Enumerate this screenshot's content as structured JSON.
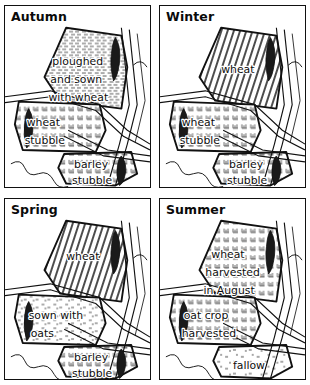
{
  "figure": {
    "kind": "seasonal-field-map-grid",
    "columns": 2,
    "rows": 2,
    "ink_color": "#111111",
    "background_color": "#ffffff"
  },
  "panels": [
    {
      "id": "autumn",
      "title": "Autumn",
      "position": "top-left",
      "labels": [
        {
          "name": "upper-field-label",
          "lines": [
            "ploughed",
            "and sown",
            "with wheat"
          ],
          "texture": "ploughed-furrows"
        },
        {
          "name": "middle-field-label",
          "lines": [
            "wheat",
            "stubble"
          ],
          "texture": "stubble-ticks"
        },
        {
          "name": "lower-field-label",
          "lines": [
            "barley",
            "stubble"
          ],
          "texture": "stubble-ticks"
        }
      ]
    },
    {
      "id": "winter",
      "title": "Winter",
      "position": "top-right",
      "labels": [
        {
          "name": "upper-field-label",
          "lines": [
            "wheat"
          ],
          "texture": "dense-diagonal-hatch"
        },
        {
          "name": "middle-field-label",
          "lines": [
            "wheat",
            "stubble"
          ],
          "texture": "stubble-ticks"
        },
        {
          "name": "lower-field-label",
          "lines": [
            "barley",
            "stubble"
          ],
          "texture": "stubble-ticks"
        }
      ]
    },
    {
      "id": "spring",
      "title": "Spring",
      "position": "bottom-left",
      "labels": [
        {
          "name": "upper-field-label",
          "lines": [
            "wheat"
          ],
          "texture": "dense-diagonal-hatch"
        },
        {
          "name": "middle-field-label",
          "lines": [
            "sown with",
            "oats"
          ],
          "texture": "stipple-seed"
        },
        {
          "name": "lower-field-label",
          "lines": [
            "barley",
            "stubble"
          ],
          "texture": "stubble-ticks"
        }
      ]
    },
    {
      "id": "summer",
      "title": "Summer",
      "position": "bottom-right",
      "labels": [
        {
          "name": "upper-field-label",
          "lines": [
            "wheat",
            "harvested",
            "in August"
          ],
          "texture": "stubble-ticks"
        },
        {
          "name": "middle-field-label",
          "lines": [
            "oat crop",
            "harvested"
          ],
          "texture": "stubble-ticks"
        },
        {
          "name": "lower-field-label",
          "lines": [
            "fallow"
          ],
          "texture": "sparse-scatter"
        }
      ]
    }
  ],
  "map_features": {
    "roads": "double-line lanes crossing the centre",
    "river": "wavy line at lower left",
    "symbol": "wheat-sheaf marker on upper field edge"
  }
}
